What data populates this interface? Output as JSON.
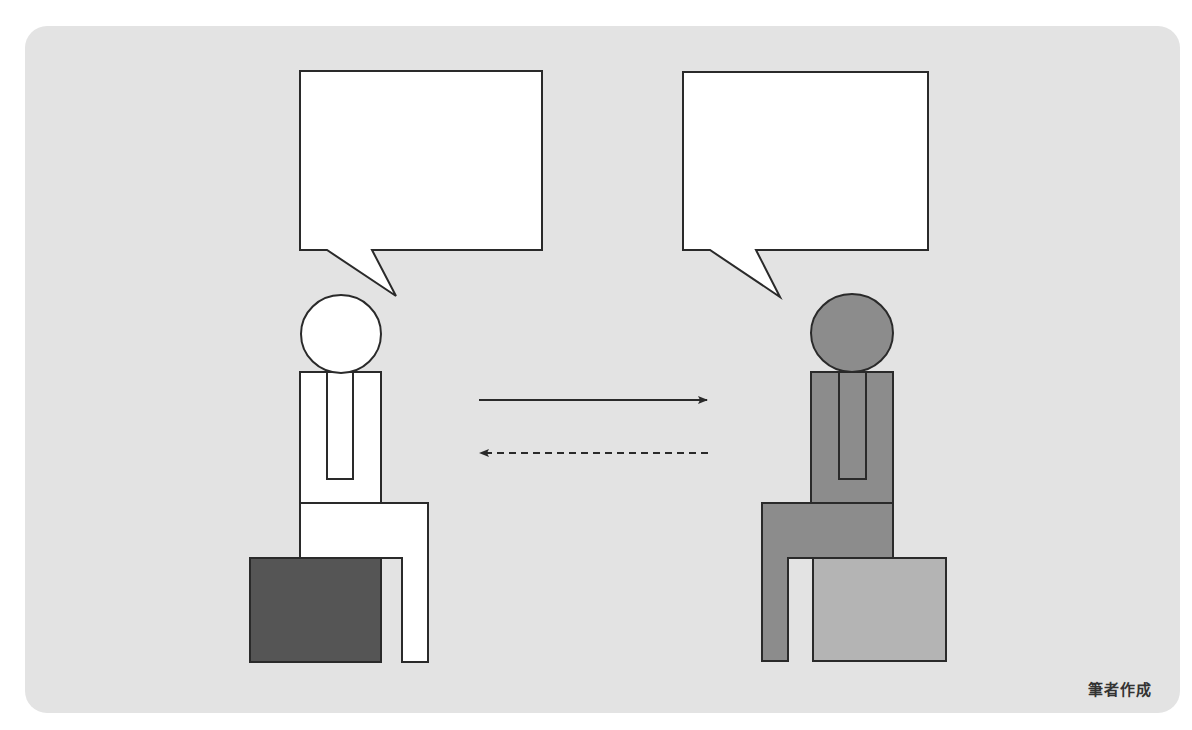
{
  "diagram": {
    "colors": {
      "background_panel": "#e3e3e3",
      "outline": "#2a2a2a",
      "left_person_fill": "#ffffff",
      "left_seat_fill": "#555555",
      "right_person_fill": "#8c8c8c",
      "right_seat_fill": "#b4b4b4",
      "bubble_fill": "#ffffff"
    },
    "left_person": {
      "label": "",
      "speech_bubble_text": ""
    },
    "right_person": {
      "label": "",
      "speech_bubble_text": ""
    },
    "arrows": [
      {
        "direction": "left-to-right",
        "style": "solid"
      },
      {
        "direction": "right-to-left",
        "style": "dashed"
      }
    ]
  },
  "credit": "筆者作成"
}
